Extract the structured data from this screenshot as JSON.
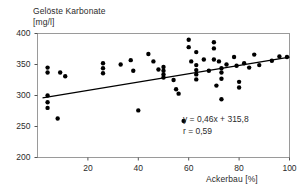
{
  "chart_data": {
    "type": "scatter",
    "title": "",
    "ylabel_line1": "Gelöste Karbonate",
    "ylabel_line2": "[mg/l]",
    "xlabel": "Ackerbau [%]",
    "xlim": [
      0,
      100
    ],
    "ylim": [
      200,
      400
    ],
    "xticks": [
      20,
      40,
      60,
      80,
      100
    ],
    "yticks": [
      200,
      250,
      300,
      350,
      400
    ],
    "xtick_labels": [
      "20",
      "40",
      "60",
      "80",
      "100"
    ],
    "ytick_labels": [
      "200",
      "250",
      "300",
      "350",
      "400"
    ],
    "grid": false,
    "legend": "none",
    "marker_color": "#000000",
    "frame_color": "#9a9a9a",
    "trendline_color": "#000000",
    "annotations": {
      "equation": "y = 0,46x + 315,8",
      "correlation": "r = 0,59",
      "slope": 0.46,
      "intercept": 315.8,
      "r": 0.59
    },
    "trendline": {
      "x_start": 2,
      "y_start": 296,
      "x_end": 100,
      "y_end": 362
    },
    "points": [
      {
        "x": 4,
        "y": 345
      },
      {
        "x": 4,
        "y": 337
      },
      {
        "x": 4,
        "y": 300
      },
      {
        "x": 4,
        "y": 289
      },
      {
        "x": 4,
        "y": 280
      },
      {
        "x": 8,
        "y": 263
      },
      {
        "x": 9,
        "y": 337
      },
      {
        "x": 11,
        "y": 331
      },
      {
        "x": 26,
        "y": 352
      },
      {
        "x": 26,
        "y": 344
      },
      {
        "x": 26,
        "y": 336
      },
      {
        "x": 33,
        "y": 350
      },
      {
        "x": 37,
        "y": 357
      },
      {
        "x": 38,
        "y": 340
      },
      {
        "x": 40,
        "y": 276
      },
      {
        "x": 44,
        "y": 367
      },
      {
        "x": 46,
        "y": 355
      },
      {
        "x": 48,
        "y": 342
      },
      {
        "x": 50,
        "y": 346
      },
      {
        "x": 50,
        "y": 340
      },
      {
        "x": 50,
        "y": 334
      },
      {
        "x": 50,
        "y": 329
      },
      {
        "x": 54,
        "y": 325
      },
      {
        "x": 55,
        "y": 310
      },
      {
        "x": 56,
        "y": 303
      },
      {
        "x": 58,
        "y": 259
      },
      {
        "x": 60,
        "y": 390
      },
      {
        "x": 60,
        "y": 378
      },
      {
        "x": 61,
        "y": 355
      },
      {
        "x": 63,
        "y": 370
      },
      {
        "x": 63,
        "y": 349
      },
      {
        "x": 63,
        "y": 341
      },
      {
        "x": 63,
        "y": 334
      },
      {
        "x": 63,
        "y": 326
      },
      {
        "x": 66,
        "y": 358
      },
      {
        "x": 68,
        "y": 340
      },
      {
        "x": 70,
        "y": 386
      },
      {
        "x": 70,
        "y": 376
      },
      {
        "x": 70,
        "y": 358
      },
      {
        "x": 71,
        "y": 316
      },
      {
        "x": 72,
        "y": 355
      },
      {
        "x": 73,
        "y": 344
      },
      {
        "x": 73,
        "y": 337
      },
      {
        "x": 73,
        "y": 327
      },
      {
        "x": 73,
        "y": 294
      },
      {
        "x": 75,
        "y": 350
      },
      {
        "x": 78,
        "y": 362
      },
      {
        "x": 79,
        "y": 348
      },
      {
        "x": 80,
        "y": 322
      },
      {
        "x": 80,
        "y": 313
      },
      {
        "x": 82,
        "y": 352
      },
      {
        "x": 84,
        "y": 345
      },
      {
        "x": 86,
        "y": 366
      },
      {
        "x": 88,
        "y": 349
      },
      {
        "x": 93,
        "y": 356
      },
      {
        "x": 96,
        "y": 363
      },
      {
        "x": 99,
        "y": 362
      }
    ]
  }
}
